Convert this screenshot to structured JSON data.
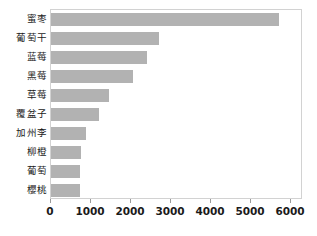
{
  "chart_data": {
    "type": "bar",
    "orientation": "horizontal",
    "title": "",
    "xlabel": "",
    "ylabel": "",
    "categories": [
      "蜜枣",
      "葡萄干",
      "蓝莓",
      "黑莓",
      "草莓",
      "覆盆子",
      "加州李",
      "柳橙",
      "葡萄",
      "櫻桃"
    ],
    "values": [
      5700,
      2700,
      2400,
      2050,
      1450,
      1200,
      870,
      740,
      730,
      720
    ],
    "xlim": [
      0,
      6300
    ],
    "xticks": [
      0,
      1000,
      2000,
      3000,
      4000,
      5000,
      6000
    ],
    "xtick_labels": [
      "0",
      "1000",
      "2000",
      "3000",
      "4000",
      "5000",
      "6000"
    ],
    "grid": false,
    "legend": false,
    "bar_color": "#b2b2b2",
    "frame_color": "#d2d2d2",
    "background": "#ffffff"
  }
}
